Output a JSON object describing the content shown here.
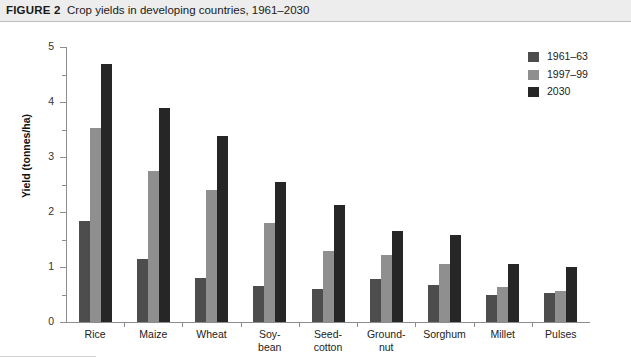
{
  "header": {
    "figure_label": "FIGURE 2",
    "title": "Crop yields in developing countries, 1961–2030"
  },
  "colors": {
    "series_1961_63": "#4d4d4d",
    "series_1997_99": "#8f8f8f",
    "series_2030": "#262626",
    "axis": "#8c8c8c",
    "header_band": "#ededed",
    "text": "#1a1a1a"
  },
  "legend": {
    "position": "top-right",
    "entries": [
      {
        "label": "1961–63",
        "color": "#4d4d4d"
      },
      {
        "label": "1997–99",
        "color": "#8f8f8f"
      },
      {
        "label": "2030",
        "color": "#262626"
      }
    ]
  },
  "axes": {
    "y_title": "Yield (tonnes/ha)",
    "y_ticks": [
      "0",
      "1",
      "2",
      "3",
      "4",
      "5"
    ],
    "y_min": 0,
    "y_max": 5,
    "y_minor_step": 0.5,
    "x_title": ""
  },
  "chart_data": {
    "type": "bar",
    "title": "Crop yields in developing countries, 1961–2030",
    "xlabel": "",
    "ylabel": "Yield (tonnes/ha)",
    "ylim": [
      0,
      5
    ],
    "ytick_step": 1,
    "yminor_step": 0.5,
    "grid": false,
    "legend_position": "top-right",
    "categories": [
      "Rice",
      "Maize",
      "Wheat",
      "Soy-\nbean",
      "Seed-\ncotton",
      "Ground-\nnut",
      "Sorghum",
      "Millet",
      "Pulses"
    ],
    "series": [
      {
        "name": "1961–63",
        "color": "#4d4d4d",
        "values": [
          1.83,
          1.15,
          0.8,
          0.65,
          0.6,
          0.78,
          0.67,
          0.5,
          0.53
        ]
      },
      {
        "name": "1997–99",
        "color": "#8f8f8f",
        "values": [
          3.53,
          2.75,
          2.4,
          1.8,
          1.3,
          1.22,
          1.05,
          0.64,
          0.57
        ]
      },
      {
        "name": "2030",
        "color": "#262626",
        "values": [
          4.7,
          3.9,
          3.38,
          2.55,
          2.12,
          1.65,
          1.58,
          1.05,
          1.0
        ]
      }
    ]
  }
}
